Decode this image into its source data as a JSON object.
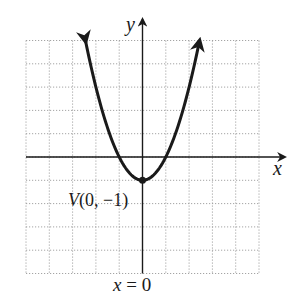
{
  "chart_data": {
    "type": "line",
    "title": "",
    "equation": "y = x^2 - 1",
    "xlabel": "x",
    "ylabel": "y",
    "xlim": [
      -5,
      5
    ],
    "ylim": [
      -5,
      5
    ],
    "grid": true,
    "grid_style": "dotted",
    "series": [
      {
        "name": "parabola",
        "x": [
          -2.5,
          -2,
          -1.5,
          -1,
          -0.5,
          0,
          0.5,
          1,
          1.5,
          2,
          2.5
        ],
        "values": [
          5.25,
          3,
          1.25,
          0,
          -0.75,
          -1,
          -0.75,
          0,
          1.25,
          3,
          5.25
        ],
        "arrows_at_ends": true
      }
    ],
    "annotations": [
      {
        "text": "V(0, −1)",
        "x": 0,
        "y": -1,
        "type": "vertex-point"
      },
      {
        "text": "x = 0",
        "type": "axis-of-symmetry-label"
      }
    ]
  },
  "labels": {
    "x_axis": "x",
    "y_axis": "y",
    "vertex_prefix": "V",
    "vertex_coords": "(0, −1)",
    "symmetry_lhs": "x",
    "symmetry_rhs": " = 0"
  },
  "colors": {
    "curve": "#1a1a1a",
    "axes": "#1a1a1a",
    "grid": "#9a9a9a",
    "background": "#ffffff"
  }
}
